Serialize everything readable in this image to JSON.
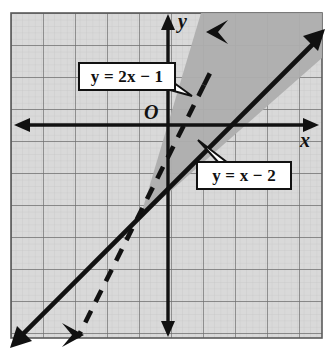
{
  "figure": {
    "type": "coordinate-plane-graph",
    "background_color": "#ffffff",
    "grid": {
      "fill_color": "#d9d9d9",
      "minor_line_color": "#c2c2c2",
      "major_line_color": "#6b6b6b",
      "border_color": "#5a5a5a",
      "minor_spacing_px": 6.4,
      "major_spacing_px": 32,
      "left_px": 11,
      "top_px": 13,
      "right_px": 322,
      "bottom_px": 338,
      "x_range": [
        -5,
        4.8
      ],
      "y_range": [
        -6.6,
        3.5
      ]
    },
    "axes": {
      "origin_px": [
        168,
        125
      ],
      "unit_px": 32,
      "axis_color": "#111111",
      "x_axis_label": "x",
      "y_axis_label": "y",
      "origin_label": "O",
      "x_axis_label_pos_px": [
        303,
        139
      ],
      "y_axis_label_pos_px": [
        181,
        20
      ],
      "origin_label_pos_px": [
        150,
        112
      ],
      "arrowheads": [
        "x-negative",
        "x-positive",
        "y-negative",
        "y-positive"
      ]
    },
    "shaded_region": {
      "name": "region-between-lines",
      "fill_color": "#b3b3b3",
      "description": "darker shaded wedge between the two lines above their intersection"
    },
    "lines": [
      {
        "name": "dashed-line",
        "equation": "y = 2x - 1",
        "slope": 2,
        "y_intercept": -1,
        "style": "dashed",
        "color": "#111111",
        "arrowheads": "both-ends"
      },
      {
        "name": "solid-line",
        "equation": "y = x - 2",
        "slope": 1,
        "y_intercept": -2,
        "style": "solid",
        "color": "#111111",
        "arrowheads": "both-ends"
      }
    ],
    "intersection_point": [
      1,
      -1
    ],
    "labels": {
      "line1": {
        "lhs": "y",
        "eq": "=",
        "rhs_coef": "2",
        "rhs_var": "x",
        "minus": "−",
        "rhs_const": "1",
        "full": "y = 2x − 1"
      },
      "line2": {
        "lhs": "y",
        "eq": "=",
        "rhs_var": "x",
        "minus": "−",
        "rhs_const": "2",
        "full": "y = x − 2"
      }
    }
  }
}
